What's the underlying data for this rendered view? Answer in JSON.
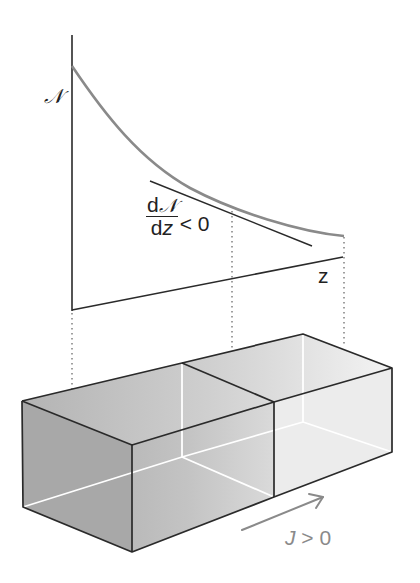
{
  "diagram": {
    "graph": {
      "y_axis_label": "𝒩",
      "x_axis_label": "z",
      "derivative": {
        "numerator_d": "d",
        "numerator_var": "𝒩",
        "denominator_d": "d",
        "denominator_var": "z",
        "relation": "< 0"
      }
    },
    "block": {
      "flux_label_var": "J",
      "flux_label_relation": " > 0",
      "flux_direction": "positive z"
    },
    "colors": {
      "axis": "#2a2a2a",
      "curve": "#8a8a8a",
      "tangent": "#2a2a2a",
      "box_edge": "#2a2a2a",
      "box_fill_dark": "#a9a9a9",
      "box_fill_light": "#eeeeee",
      "flux_arrow": "#8a8a8a"
    }
  }
}
